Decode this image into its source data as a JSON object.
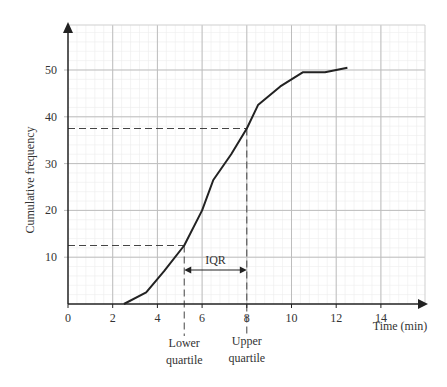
{
  "chart_data": {
    "type": "line",
    "title": "",
    "xlabel": "Time (min)",
    "ylabel": "Cumulative frequency",
    "xlim": [
      0,
      16
    ],
    "ylim": [
      0,
      55
    ],
    "x_ticks": [
      0,
      2,
      4,
      6,
      8,
      10,
      12,
      14
    ],
    "y_ticks": [
      10,
      20,
      30,
      40,
      50
    ],
    "grid": true,
    "legend": null,
    "series": [
      {
        "name": "Cumulative frequency",
        "x": [
          2.5,
          3.5,
          4.3,
          5.2,
          6.0,
          6.5,
          7.3,
          8.0,
          8.5,
          9.5,
          10.5,
          11.5,
          12.5
        ],
        "y": [
          0,
          2.5,
          7,
          12.5,
          20,
          26.5,
          32,
          37.5,
          42.5,
          46.5,
          49.5,
          49.5,
          50.5
        ]
      }
    ],
    "annotations": {
      "lower_quartile": {
        "x": 5.2,
        "y": 12.5,
        "label_line1": "Lower",
        "label_line2": "quartile"
      },
      "upper_quartile": {
        "x": 8.0,
        "y": 37.5,
        "label_line1": "Upper",
        "label_line2": "quartile"
      },
      "iqr_label": "IQR"
    }
  }
}
